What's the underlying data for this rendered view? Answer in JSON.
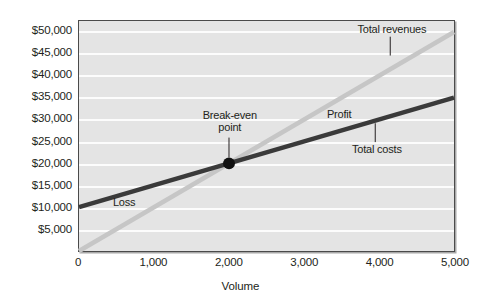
{
  "chart_data": {
    "type": "line",
    "title": "",
    "xlabel": "Volume",
    "ylabel": "",
    "xlim": [
      0,
      5000
    ],
    "ylim": [
      0,
      52500
    ],
    "grid": true,
    "legend": "none",
    "xticks": [
      "0",
      "1,000",
      "2,000",
      "3,000",
      "4,000",
      "5,000"
    ],
    "xtick_values": [
      0,
      1000,
      2000,
      3000,
      4000,
      5000
    ],
    "yticks": [
      "$5,000",
      "$10,000",
      "$15,000",
      "$20,000",
      "$25,000",
      "$30,000",
      "$35,000",
      "$40,000",
      "$45,000",
      "$50,000"
    ],
    "ytick_values": [
      5000,
      10000,
      15000,
      20000,
      25000,
      30000,
      35000,
      40000,
      45000,
      50000
    ],
    "series": [
      {
        "name": "Total revenues",
        "color": "#c6c6c6",
        "x": [
          0,
          5000
        ],
        "values": [
          0,
          50000
        ]
      },
      {
        "name": "Total costs",
        "color": "#3a3a3a",
        "x": [
          0,
          5000
        ],
        "values": [
          10000,
          35000
        ]
      }
    ],
    "annotations": [
      {
        "name": "break-even-point",
        "label_line1": "Break-even",
        "label_line2": "point",
        "x": 2000,
        "y": 20000
      },
      {
        "name": "loss-region",
        "label": "Loss",
        "x": 450,
        "y": 11500
      },
      {
        "name": "profit-region",
        "label": "Profit",
        "x": 3450,
        "y": 31500
      },
      {
        "name": "total-revenues-callout",
        "label": "Total revenues",
        "x": 4150,
        "y": 50500
      },
      {
        "name": "total-costs-callout",
        "label": "Total costs",
        "x": 3950,
        "y": 23500
      }
    ]
  },
  "axis": {
    "x_title": "Volume"
  },
  "labels": {
    "break_even_line1": "Break-even",
    "break_even_line2": "point",
    "loss": "Loss",
    "profit": "Profit",
    "total_revenues": "Total revenues",
    "total_costs": "Total costs"
  },
  "colors": {
    "revenue_line": "#c6c6c6",
    "cost_line": "#3a3a3a",
    "plot_bg": "#e4e4e4",
    "gridline": "#fcfcfc",
    "frame": "#4a4a4a",
    "text": "#231f20"
  }
}
